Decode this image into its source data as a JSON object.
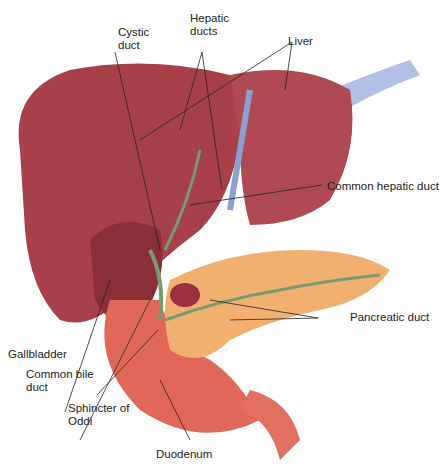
{
  "figure": {
    "labels": {
      "cystic_duct": [
        "Cystic",
        "duct"
      ],
      "hepatic_ducts": [
        "Hepatic",
        "ducts"
      ],
      "liver": "Liver",
      "common_hepatic_duct": "Common hepatic duct",
      "pancreatic_duct": "Pancreatic duct",
      "gallbladder": "Gallbladder",
      "common_bile_duct": [
        "Common bile",
        "duct"
      ],
      "sphincter_of_oddi": [
        "Sphincter of",
        "Oddi"
      ],
      "duodenum": "Duodenum"
    },
    "colors": {
      "liver": "#a8404a",
      "pancreas": "#f2b070",
      "duodenum": "#e06858",
      "duct": "#7a9a70",
      "vein": "#8aa0d0"
    }
  }
}
